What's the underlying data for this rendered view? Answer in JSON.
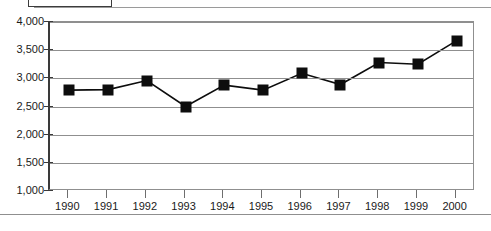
{
  "legend": {
    "fragment_visible": true
  },
  "chart_data": {
    "type": "line",
    "title": "",
    "subtitle": "",
    "xlabel": "",
    "ylabel": "",
    "categories": [
      "1990",
      "1991",
      "1992",
      "1993",
      "1994",
      "1995",
      "1996",
      "1997",
      "1998",
      "1999",
      "2000"
    ],
    "values": [
      2790,
      2800,
      2960,
      2500,
      2880,
      2790,
      3090,
      2890,
      3280,
      3250,
      3670
    ],
    "series": [
      {
        "name": "series-1",
        "values": [
          2790,
          2800,
          2960,
          2500,
          2880,
          2790,
          3090,
          2890,
          3280,
          3250,
          3670
        ],
        "marker": "square",
        "color": "#0d0d0d"
      }
    ],
    "ylim": [
      1000,
      4000
    ],
    "yticks": [
      1000,
      1500,
      2000,
      2500,
      3000,
      3500,
      4000
    ],
    "ytick_labels": [
      "1,000",
      "1,500",
      "2,000",
      "2,500",
      "3,000",
      "3,500",
      "4,000"
    ],
    "xtick_labels": [
      "1990",
      "1991",
      "1992",
      "1993",
      "1994",
      "1995",
      "1996",
      "1997",
      "1998",
      "1999",
      "2000"
    ],
    "grid": true,
    "grid_axis": "y",
    "legend_position": "top-left-cropped",
    "colors": {
      "line": "#0d0d0d",
      "marker": "#0d0d0d",
      "grid": "#8f8f8f",
      "axis": "#3a3a3a",
      "text": "#1a1a1a",
      "background": "#ffffff"
    }
  }
}
